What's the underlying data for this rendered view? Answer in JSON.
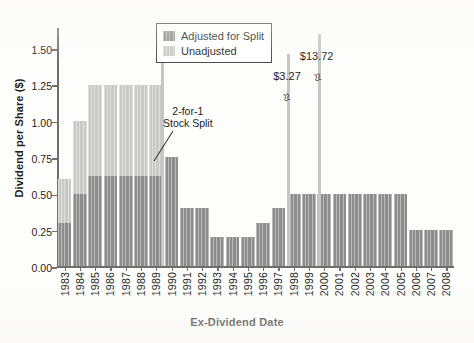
{
  "chart_data": {
    "type": "bar",
    "title": "",
    "xlabel": "Ex-Dividend Date",
    "ylabel": "Dividend per Share ($)",
    "ylim": [
      0.0,
      1.65
    ],
    "yticks": [
      "0.00",
      "0.25",
      "0.50",
      "0.75",
      "1.00",
      "1.25",
      "1.50"
    ],
    "ytick_values": [
      0.0,
      0.25,
      0.5,
      0.75,
      1.0,
      1.25,
      1.5
    ],
    "grid": false,
    "legend_position": "top-center",
    "categories": [
      "1983",
      "1984",
      "1985",
      "1986",
      "1987",
      "1988",
      "1989",
      "1990",
      "1991",
      "1992",
      "1993",
      "1994",
      "1995",
      "1996",
      "1997",
      "1998",
      "1999",
      "2000",
      "2001",
      "2002",
      "2003",
      "2004",
      "2005",
      "2006",
      "2007",
      "2008"
    ],
    "series": [
      {
        "name": "Adjusted for Split",
        "color": "#8d8d8d",
        "values": [
          0.3,
          0.5,
          0.625,
          0.625,
          0.625,
          0.625,
          0.625,
          0.75,
          0.4,
          0.4,
          0.2,
          0.2,
          0.2,
          0.3,
          0.4,
          0.5,
          0.5,
          0.5,
          0.5,
          0.5,
          0.5,
          0.5,
          0.5,
          0.25,
          0.25,
          0.25
        ]
      },
      {
        "name": "Unadjusted",
        "color": "#c9c9c7",
        "values": [
          0.6,
          1.0,
          1.25,
          1.25,
          1.25,
          1.25,
          1.25,
          null,
          null,
          null,
          null,
          null,
          null,
          null,
          null,
          null,
          null,
          null,
          null,
          null,
          null,
          null,
          null,
          null,
          null,
          null
        ]
      }
    ],
    "annotations": [
      {
        "text": "2-for-1\nStock Split",
        "line1": "2-for-1",
        "line2": "Stock Split",
        "points_to": "1990"
      },
      {
        "text": "$3.27",
        "value": 3.27,
        "at": "1998",
        "kind": "broken-axis-spike"
      },
      {
        "text": "$13.72",
        "value": 13.72,
        "at": "2000",
        "kind": "broken-axis-spike"
      }
    ],
    "extra_spike": {
      "at": "1989",
      "top_value": 1.49,
      "series": "Unadjusted"
    },
    "colors": {
      "dark": "#8d8d8d",
      "light": "#c9c9c7",
      "axis": "#6e6e6e",
      "text": "#231f20"
    }
  },
  "legend": {
    "items": [
      {
        "label": "Adjusted for Split",
        "swatch": "dark"
      },
      {
        "label": "Unadjusted",
        "swatch": "light"
      }
    ]
  },
  "annotation": {
    "split_line1": "2-for-1",
    "split_line2": "Stock Split",
    "spike_1998": "$3.27",
    "spike_2000": "$13.72"
  },
  "axes": {
    "y_title": "Dividend per Share ($)",
    "x_title": "Ex-Dividend Date"
  }
}
